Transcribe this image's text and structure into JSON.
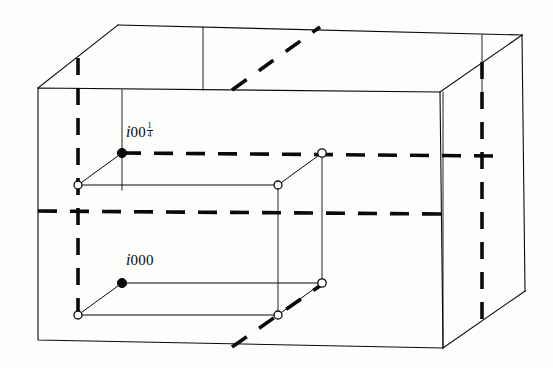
{
  "figure": {
    "type": "line-diagram",
    "background_color": "#fdfdfb",
    "stroke_color": "#0a0a0a",
    "thin_stroke_width": 1.1,
    "thick_dash_width": 3.4,
    "canvas": {
      "width": 553,
      "height": 368
    }
  },
  "labels": {
    "upper": {
      "symbol": "i",
      "subscript_digits": "00",
      "fraction_numerator": "1",
      "fraction_denominator": "4",
      "full_text": "i00 1/4",
      "anchor_point": {
        "x": 122,
        "y": 153
      }
    },
    "lower": {
      "symbol": "i",
      "subscript_digits": "000",
      "full_text": "i000",
      "anchor_point": {
        "x": 122,
        "y": 283
      }
    }
  },
  "geometry": {
    "outer_box": {
      "front_face": [
        {
          "x": 38,
          "y": 88
        },
        {
          "x": 440,
          "y": 92
        },
        {
          "x": 443,
          "y": 348
        },
        {
          "x": 38,
          "y": 340
        }
      ],
      "back_face": [
        {
          "x": 118,
          "y": 25
        },
        {
          "x": 522,
          "y": 35
        },
        {
          "x": 525,
          "y": 291
        },
        {
          "x": 118,
          "y": 282
        }
      ],
      "visible_back_edges": [
        "top-back",
        "right-back",
        "top-left-diag",
        "top-right-diag",
        "bottom-right-diag"
      ]
    },
    "upper_layer": {
      "filled_node": {
        "x": 122,
        "y": 153
      },
      "open_nodes": [
        {
          "x": 78,
          "y": 185
        },
        {
          "x": 278,
          "y": 185
        },
        {
          "x": 322,
          "y": 153
        }
      ],
      "dashed_row_y": 153,
      "dashed_row_x_start": 122,
      "dashed_row_x_end": 500
    },
    "lower_layer": {
      "filled_node": {
        "x": 122,
        "y": 283
      },
      "open_nodes": [
        {
          "x": 78,
          "y": 315
        },
        {
          "x": 278,
          "y": 315
        },
        {
          "x": 322,
          "y": 283
        }
      ]
    },
    "mid_dashed_row": {
      "y": 212,
      "x_start": 38,
      "x_end": 443
    },
    "vertical_dashed_lines": [
      {
        "x": 78,
        "y_start": 58,
        "y_end": 318
      },
      {
        "x": 482,
        "y_start": 62,
        "y_end": 330
      }
    ],
    "diagonal_dashed_lines": [
      {
        "x1": 232,
        "y1": 90,
        "x2": 318,
        "y2": 28,
        "face": "top"
      },
      {
        "x1": 232,
        "y1": 346,
        "x2": 322,
        "y2": 284,
        "face": "bottom"
      }
    ],
    "thin_vertical_connectors": [
      {
        "x": 122,
        "y_start": 90,
        "y_end": 188
      },
      {
        "x": 278,
        "y_start": 185,
        "y_end": 318
      },
      {
        "x": 322,
        "y_start": 153,
        "y_end": 286
      },
      {
        "x": 203,
        "y_start": 27,
        "y_end": 90
      },
      {
        "x": 482,
        "y_start": 35,
        "y_end": 92
      }
    ]
  },
  "legend": {
    "filled_circle_meaning": "i site labelled",
    "open_circle_meaning": "equivalent i site",
    "dashed_line_meaning": "hidden / back edge"
  }
}
